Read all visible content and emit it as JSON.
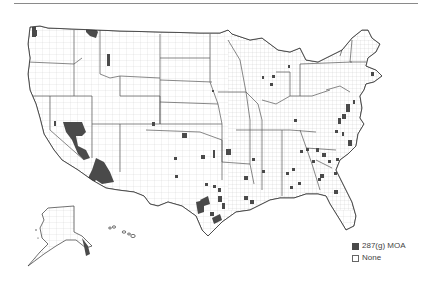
{
  "map": {
    "title": "",
    "region": "United States counties",
    "colors": {
      "moa": "#4a4a4a",
      "none": "#ffffff",
      "county_border": "#bdbdbd",
      "state_border": "#555555"
    },
    "legend": {
      "items": [
        {
          "label": "287(g) MOA",
          "color": "#4a4a4a"
        },
        {
          "label": "None",
          "color": "#ffffff"
        }
      ]
    },
    "highlighted_regions": [
      "Washington (Puget Sound)",
      "Montana (north-central)",
      "Idaho/Montana border",
      "Nevada",
      "California (Inland Empire)",
      "Arizona (Maricopa/Pinal)",
      "Colorado",
      "Kansas",
      "Oklahoma",
      "Texas",
      "Louisiana",
      "Arkansas",
      "Missouri",
      "Wisconsin",
      "Michigan",
      "Ohio",
      "Virginia",
      "Maryland",
      "North Carolina",
      "South Carolina",
      "Georgia",
      "Alabama",
      "Florida",
      "Massachusetts",
      "Maine",
      "New Hampshire",
      "Alaska (southeast)"
    ]
  }
}
